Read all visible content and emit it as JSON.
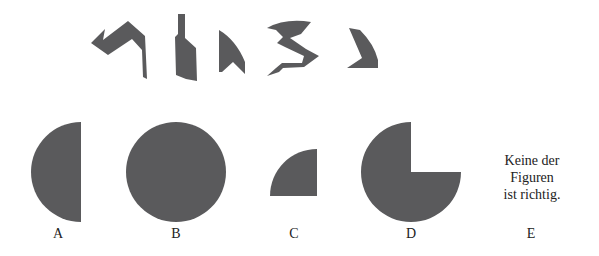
{
  "puzzle": {
    "pieces_count": 5,
    "fill_color": "#5a5a5c",
    "options": [
      {
        "id": "A",
        "label": "A",
        "shape": "half-circle-left"
      },
      {
        "id": "B",
        "label": "B",
        "shape": "full-circle"
      },
      {
        "id": "C",
        "label": "C",
        "shape": "quarter-circle"
      },
      {
        "id": "D",
        "label": "D",
        "shape": "three-quarter-circle"
      },
      {
        "id": "E",
        "label": "E",
        "shape": "text",
        "text_lines": [
          "Keine der",
          "Figuren",
          "ist richtig."
        ]
      }
    ]
  }
}
